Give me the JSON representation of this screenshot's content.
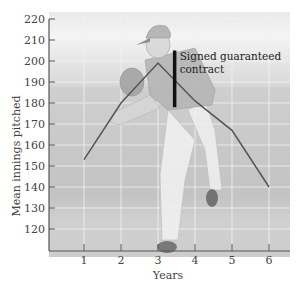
{
  "chart_data": {
    "type": "line",
    "title": "",
    "xlabel": "Years",
    "ylabel": "Mean innings pitched",
    "x": [
      1,
      2,
      3,
      4,
      5,
      6
    ],
    "x_tick_labels": [
      "1",
      "2",
      "3",
      "4",
      "5",
      "6"
    ],
    "y_tick_labels": [
      "120",
      "130",
      "140",
      "150",
      "160",
      "170",
      "180",
      "190",
      "200",
      "210",
      "220"
    ],
    "ylim": [
      110,
      220
    ],
    "xlim": [
      0.3,
      6.6
    ],
    "grid": true,
    "series": [
      {
        "name": "Mean innings pitched",
        "values": [
          153,
          180,
          199,
          181,
          167,
          140
        ],
        "color": "#555555"
      }
    ],
    "annotations": [
      {
        "text_line1": "Signed guaranteed",
        "text_line2": "contract",
        "x": 3.45,
        "y_from": 178,
        "y_to": 205
      }
    ],
    "background": "photo illustration of a baseball pitcher mid-throw"
  }
}
